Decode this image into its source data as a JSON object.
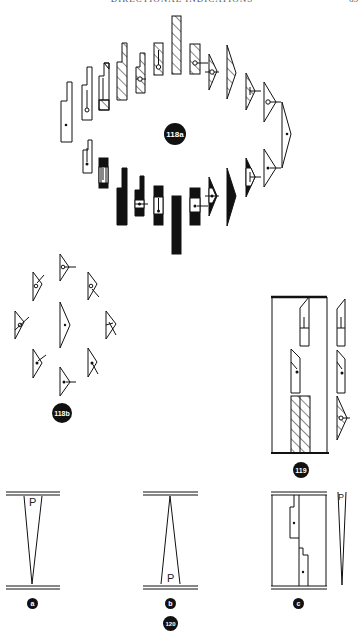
{
  "page": {
    "running_head": "DIRECTIONAL INDICATIONS",
    "page_number": "65"
  },
  "figures": {
    "fig118a": {
      "label": "118a"
    },
    "fig118b": {
      "label": "118b"
    },
    "fig119": {
      "label": "119"
    },
    "fig120": {
      "label": "120",
      "panels": [
        {
          "label": "a",
          "letter": "P"
        },
        {
          "label": "b",
          "letter": "P"
        },
        {
          "label": "c",
          "letter": "P"
        }
      ]
    }
  }
}
